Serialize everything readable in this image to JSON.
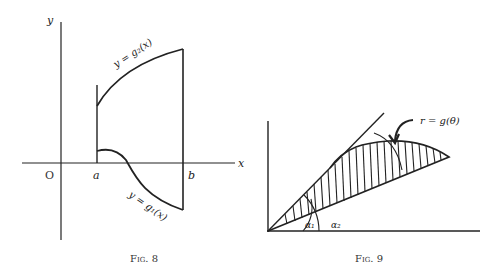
{
  "figures": [
    {
      "caption": "Fig. 8",
      "axes": {
        "x_label": "x",
        "y_label": "y",
        "origin_label": "O"
      },
      "ticks": {
        "a": "a",
        "b": "b"
      },
      "curves": {
        "upper": "y = g₂(x)",
        "lower": "y = g₁(x)"
      }
    },
    {
      "caption": "Fig. 9",
      "curve_label": "r = g(θ)",
      "angles": {
        "alpha1": "α₁",
        "alpha2": "α₂"
      }
    }
  ]
}
